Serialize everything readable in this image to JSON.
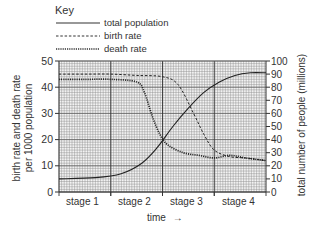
{
  "key": {
    "title": "Key",
    "items": [
      {
        "label": "total population",
        "style": "solid"
      },
      {
        "label": "birth rate",
        "style": "dashed"
      },
      {
        "label": "death rate",
        "style": "dotted"
      }
    ]
  },
  "axes": {
    "left_label_line1": "birth rate and death rate",
    "left_label_line2": "per 1000 population",
    "right_label": "total number of people (millions)",
    "x_label": "time",
    "x_arrow": "→",
    "left_ticks": [
      "0",
      "10",
      "20",
      "30",
      "40",
      "50"
    ],
    "right_ticks": [
      "0",
      "10",
      "20",
      "30",
      "40",
      "50",
      "60",
      "70",
      "80",
      "90",
      "100"
    ],
    "stages": [
      "stage 1",
      "stage 2",
      "stage 3",
      "stage 4"
    ]
  },
  "chart_data": {
    "type": "line",
    "title": "",
    "xlabel": "time",
    "ylabel": "birth rate and death rate per 1000 population",
    "y2label": "total number of people (millions)",
    "x_categories": [
      "stage 1",
      "stage 2",
      "stage 3",
      "stage 4"
    ],
    "xlim": [
      0,
      4
    ],
    "ylim": [
      0,
      50
    ],
    "y2lim": [
      0,
      100
    ],
    "grid": true,
    "legend_position": "top-left (Key)",
    "series": [
      {
        "name": "birth rate",
        "axis": "left",
        "style": "dashed",
        "x": [
          0,
          0.5,
          1,
          1.5,
          2,
          2.3,
          2.6,
          2.8,
          3,
          3.3,
          3.6,
          4
        ],
        "y": [
          45,
          45,
          45,
          44.5,
          44,
          41,
          30,
          22,
          16,
          13.5,
          13,
          12
        ]
      },
      {
        "name": "death rate",
        "axis": "left",
        "style": "dotted",
        "x": [
          0,
          0.5,
          1,
          1.5,
          1.65,
          1.8,
          1.95,
          2.1,
          2.4,
          2.7,
          3,
          3.3,
          3.6,
          4
        ],
        "y": [
          43,
          43,
          43,
          42,
          38,
          29,
          22,
          18,
          15,
          14,
          13,
          14,
          13,
          12
        ]
      },
      {
        "name": "total population",
        "axis": "right",
        "style": "solid",
        "x": [
          0,
          0.7,
          1.2,
          1.6,
          1.9,
          2.2,
          2.5,
          2.8,
          3.1,
          3.4,
          3.7,
          4
        ],
        "y": [
          10,
          11,
          14,
          22,
          34,
          50,
          64,
          76,
          84,
          89,
          91,
          91
        ]
      }
    ]
  }
}
